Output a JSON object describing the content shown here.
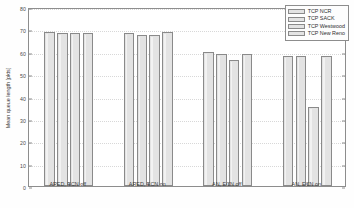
{
  "chart_data": {
    "type": "bar",
    "title": "",
    "xlabel": "",
    "ylabel": "Mean queue length [pkts]",
    "ylim": [
      0,
      80
    ],
    "yticks": [
      0,
      10,
      20,
      30,
      40,
      50,
      60,
      70,
      80
    ],
    "grid": true,
    "legend_position": "top-right",
    "categories": [
      "ARED, ECN off",
      "ARED, ECN on",
      "AN, ECN off",
      "AN, ECN on"
    ],
    "series": [
      {
        "name": "TCP NCR",
        "values": [
          69.0,
          68.2,
          60.0,
          58.2
        ]
      },
      {
        "name": "TCP SACK",
        "values": [
          68.3,
          67.3,
          59.2,
          58.2
        ]
      },
      {
        "name": "TCP Westwood",
        "values": [
          68.3,
          67.3,
          56.2,
          35.5
        ]
      },
      {
        "name": "TCP New Reno",
        "values": [
          68.6,
          68.7,
          59.2,
          58.2
        ]
      }
    ]
  },
  "axis": {
    "y_label": "Mean queue length [pkts]",
    "y_tick_labels": [
      "0",
      "10",
      "20",
      "30",
      "40",
      "50",
      "60",
      "70",
      "80"
    ],
    "x_tick_labels": [
      "ARED, ECN off",
      "ARED, ECN on",
      "AN, ECN off",
      "AN, ECN on"
    ]
  },
  "legend": {
    "entries": [
      {
        "label": "TCP NCR"
      },
      {
        "label": "TCP SACK"
      },
      {
        "label": "TCP Westwood"
      },
      {
        "label": "TCP New Reno"
      }
    ]
  },
  "colors": {
    "bar_fill": "#e3e3e3",
    "bar_edge": "#8a8a8a",
    "axis": "#8d8d8d",
    "grid": "#d8d8d8",
    "text": "#3a3a3a"
  }
}
